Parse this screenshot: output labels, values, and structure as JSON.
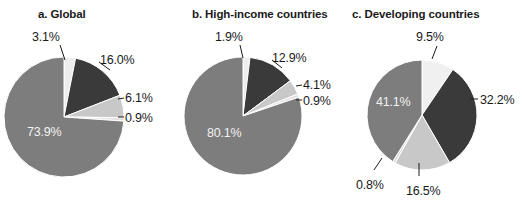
{
  "figure": {
    "background": "#ffffff",
    "panels": [
      {
        "id": "a",
        "title": "a. Global",
        "title_x": 38,
        "center": [
          64,
          117
        ],
        "radius": 60,
        "start_angle": -90,
        "slices": [
          {
            "label": "3.1%",
            "value": 3.1,
            "color": "#ededed",
            "text_pos": [
              32,
              30
            ],
            "inside": false,
            "leader": [
              [
                60,
                45
              ],
              [
                65,
                60
              ]
            ]
          },
          {
            "label": "16.0%",
            "value": 16.0,
            "color": "#3a3a3a",
            "text_pos": [
              100,
              53
            ],
            "inside": false,
            "leader": [
              [
                99,
                62
              ],
              [
                110,
                70
              ]
            ]
          },
          {
            "label": "6.1%",
            "value": 6.1,
            "color": "#c8c8c8",
            "text_pos": [
              125,
              91
            ],
            "inside": false,
            "leader": [
              [
                118,
                99
              ],
              [
                124,
                98
              ]
            ]
          },
          {
            "label": "0.9%",
            "value": 0.9,
            "color": "#e2e2e2",
            "text_pos": [
              125,
              111
            ],
            "inside": false,
            "leader": [
              [
                118,
                117
              ],
              [
                124,
                117
              ]
            ]
          },
          {
            "label": "73.9%",
            "value": 73.9,
            "color": "#7d7d7d",
            "text_pos": [
              27,
              125
            ],
            "inside": true,
            "leader": null
          }
        ]
      },
      {
        "id": "b",
        "title": "b. High-income countries",
        "title_x": 192,
        "center": [
          243,
          116
        ],
        "radius": 59,
        "start_angle": -90,
        "slices": [
          {
            "label": "1.9%",
            "value": 1.9,
            "color": "#ededed",
            "text_pos": [
              215,
              30
            ],
            "inside": false,
            "leader": [
              [
                240,
                45
              ],
              [
                243,
                58
              ]
            ]
          },
          {
            "label": "12.9%",
            "value": 12.9,
            "color": "#3a3a3a",
            "text_pos": [
              272,
              51
            ],
            "inside": false,
            "leader": [
              [
                272,
                60
              ],
              [
                282,
                68
              ]
            ]
          },
          {
            "label": "4.1%",
            "value": 4.1,
            "color": "#c8c8c8",
            "text_pos": [
              303,
              78
            ],
            "inside": false,
            "leader": [
              [
                296,
                86
              ],
              [
                302,
                85
              ]
            ]
          },
          {
            "label": "0.9%",
            "value": 0.9,
            "color": "#e2e2e2",
            "text_pos": [
              303,
              94
            ],
            "inside": false,
            "leader": [
              [
                296,
                100
              ],
              [
                302,
                100
              ]
            ]
          },
          {
            "label": "80.1%",
            "value": 80.1,
            "color": "#7d7d7d",
            "text_pos": [
              207,
              126
            ],
            "inside": true,
            "leader": null
          }
        ]
      },
      {
        "id": "c",
        "title": "c. Developing countries",
        "title_x": 352,
        "center": [
          422,
          115
        ],
        "radius": 55,
        "start_angle": -90,
        "slices": [
          {
            "label": "9.5%",
            "value": 9.5,
            "color": "#f0f0f0",
            "text_pos": [
              416,
              30
            ],
            "inside": false,
            "leader": [
              [
                437,
                46
              ],
              [
                432,
                59
              ]
            ]
          },
          {
            "label": "32.2%",
            "value": 32.2,
            "color": "#3a3a3a",
            "text_pos": [
              480,
              93
            ],
            "inside": false,
            "leader": [
              [
                470,
                99
              ],
              [
                478,
                99
              ]
            ]
          },
          {
            "label": "16.5%",
            "value": 16.5,
            "color": "#c8c8c8",
            "text_pos": [
              406,
              184
            ],
            "inside": false,
            "leader": [
              [
                419,
                163
              ],
              [
                419,
                176
              ]
            ]
          },
          {
            "label": "0.8%",
            "value": 0.8,
            "color": "#dcdcdc",
            "text_pos": [
              356,
              178
            ],
            "inside": false,
            "leader": [
              [
                382,
                158
              ],
              [
                374,
                170
              ]
            ]
          },
          {
            "label": "41.1%",
            "value": 41.1,
            "color": "#7d7d7d",
            "text_pos": [
              376,
              95
            ],
            "inside": true,
            "leader": null
          }
        ]
      }
    ]
  },
  "chart_data": [
    {
      "type": "pie",
      "title": "a. Global",
      "categories": [
        "3.1%",
        "16.0%",
        "6.1%",
        "0.9%",
        "73.9%"
      ],
      "values": [
        3.1,
        16.0,
        6.1,
        0.9,
        73.9
      ],
      "colors": [
        "#ededed",
        "#3a3a3a",
        "#c8c8c8",
        "#e2e2e2",
        "#7d7d7d"
      ],
      "start_angle": -90,
      "direction": "clockwise",
      "legend": "none",
      "xlabel": "",
      "ylabel": ""
    },
    {
      "type": "pie",
      "title": "b. High-income countries",
      "categories": [
        "1.9%",
        "12.9%",
        "4.1%",
        "0.9%",
        "80.1%"
      ],
      "values": [
        1.9,
        12.9,
        4.1,
        0.9,
        80.1
      ],
      "colors": [
        "#ededed",
        "#3a3a3a",
        "#c8c8c8",
        "#e2e2e2",
        "#7d7d7d"
      ],
      "start_angle": -90,
      "direction": "clockwise",
      "legend": "none",
      "xlabel": "",
      "ylabel": ""
    },
    {
      "type": "pie",
      "title": "c. Developing countries",
      "categories": [
        "9.5%",
        "32.2%",
        "16.5%",
        "0.8%",
        "41.1%"
      ],
      "values": [
        9.5,
        32.2,
        16.5,
        0.8,
        41.1
      ],
      "colors": [
        "#f0f0f0",
        "#3a3a3a",
        "#c8c8c8",
        "#dcdcdc",
        "#7d7d7d"
      ],
      "start_angle": -90,
      "direction": "clockwise",
      "legend": "none",
      "xlabel": "",
      "ylabel": ""
    }
  ]
}
